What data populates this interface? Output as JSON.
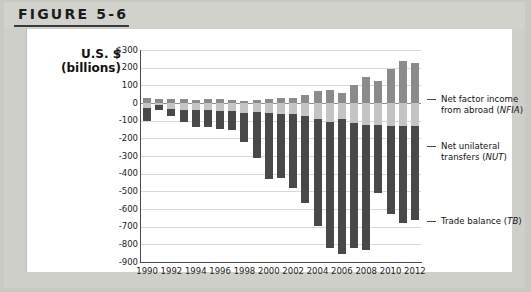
{
  "figure": {
    "number_label": "FIGURE 5-6"
  },
  "axis_title": {
    "line1": "U.S. $",
    "line2": "(billions)"
  },
  "legend": {
    "items": [
      {
        "name": "nfia",
        "line1": "Net factor income",
        "line2": "from abroad (NFIA)",
        "color": "#8b8b8b"
      },
      {
        "name": "nut",
        "line1": "Net unilateral",
        "line2": "transfers (NUT)",
        "color": "#c4c4c4"
      },
      {
        "name": "tb",
        "line1": "Trade balance (TB)",
        "line2": "",
        "color": "#494949"
      }
    ]
  },
  "chart_data": {
    "type": "bar",
    "stacked": true,
    "title": "FIGURE 5-6",
    "xlabel": "",
    "ylabel": "U.S. $ (billions)",
    "ylim": [
      -900,
      300
    ],
    "ytick_labels": [
      "$300",
      "200",
      "100",
      "0",
      "-100",
      "-200",
      "-300",
      "-400",
      "-500",
      "-600",
      "-700",
      "-800",
      "-900"
    ],
    "ytick_values": [
      300,
      200,
      100,
      0,
      -100,
      -200,
      -300,
      -400,
      -500,
      -600,
      -700,
      -800,
      -900
    ],
    "grid": true,
    "legend_position": "right",
    "x": [
      1990,
      1991,
      1992,
      1993,
      1994,
      1995,
      1996,
      1997,
      1998,
      1999,
      2000,
      2001,
      2002,
      2003,
      2004,
      2005,
      2006,
      2007,
      2008,
      2009,
      2010,
      2011,
      2012
    ],
    "xtick_labels": [
      "1990",
      "1992",
      "1994",
      "1996",
      "1998",
      "2000",
      "2002",
      "2004",
      "2006",
      "2008",
      "2010",
      "2012"
    ],
    "series": [
      {
        "name": "Net factor income from abroad (NFIA)",
        "key": "NFIA",
        "color": "#8b8b8b",
        "values": [
          29,
          25,
          23,
          25,
          17,
          21,
          23,
          17,
          12,
          15,
          21,
          28,
          28,
          45,
          70,
          72,
          55,
          100,
          150,
          125,
          190,
          240,
          225
        ]
      },
      {
        "name": "Net unilateral transfers (NUT)",
        "key": "NUT",
        "color": "#c4c4c4",
        "values": [
          -27,
          -10,
          -36,
          -38,
          -40,
          -39,
          -43,
          -45,
          -54,
          -50,
          -58,
          -64,
          -65,
          -72,
          -88,
          -105,
          -92,
          -115,
          -125,
          -125,
          -132,
          -133,
          -130
        ]
      },
      {
        "name": "Trade balance (TB)",
        "key": "TB",
        "color": "#494949",
        "values": [
          -77,
          -28,
          -35,
          -70,
          -98,
          -96,
          -104,
          -108,
          -167,
          -259,
          -372,
          -361,
          -418,
          -494,
          -610,
          -714,
          -762,
          -705,
          -709,
          -384,
          -495,
          -548,
          -535
        ]
      }
    ]
  }
}
